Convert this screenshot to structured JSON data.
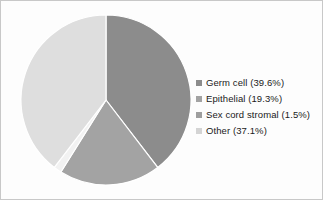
{
  "chart_data": {
    "type": "pie",
    "title": "",
    "subtitle": "",
    "xlabel": "",
    "ylabel": "",
    "legend_position": "right",
    "grid": false,
    "start_angle_deg": 0,
    "direction": "clockwise",
    "categories": [
      "Germ cell",
      "Epithelial",
      "Sex cord stromal",
      "Other"
    ],
    "values": [
      39.6,
      19.3,
      1.5,
      37.1
    ],
    "value_unit": "%",
    "colors": [
      "#8c8c8c",
      "#a3a3a3",
      "#f2f2f2",
      "#dedede"
    ],
    "slices": [
      {
        "label": "Germ cell",
        "value": 39.6,
        "legend_text": "Germ cell (39.6%)",
        "color": "#8c8c8c",
        "start_deg": 0.0,
        "end_deg": 142.56
      },
      {
        "label": "Epithelial",
        "value": 19.3,
        "legend_text": "Epithelial (19.3%)",
        "color": "#a3a3a3",
        "start_deg": 142.56,
        "end_deg": 212.04
      },
      {
        "label": "Sex cord stromal",
        "value": 1.5,
        "legend_text": "Sex cord stromal (1.5%)",
        "color": "#f2f2f2",
        "start_deg": 212.04,
        "end_deg": 217.44
      },
      {
        "label": "Other",
        "value": 37.1,
        "legend_text": "Other (37.1%)",
        "color": "#dedede",
        "start_deg": 217.44,
        "end_deg": 360.0
      }
    ]
  },
  "legend": {
    "items": [
      {
        "label": "Germ cell (39.6%)",
        "swatch_color": "#8c8c8c",
        "icon": "square-marker-icon"
      },
      {
        "label": "Epithelial (19.3%)",
        "swatch_color": "#a3a3a3",
        "icon": "square-marker-icon"
      },
      {
        "label": "Sex cord stromal (1.5%)",
        "swatch_color": "#9e9e9e",
        "icon": "square-marker-icon"
      },
      {
        "label": "Other (37.1%)",
        "swatch_color": "#d4d4d4",
        "icon": "square-marker-icon"
      }
    ]
  },
  "style": {
    "background": "#fdfdfd",
    "border_color": "#c8c8c8",
    "slice_divider_color": "#ffffff",
    "text_color": "#1a1a1a"
  },
  "geometry": {
    "center_x": 105,
    "center_y": 99,
    "radius": 85
  }
}
